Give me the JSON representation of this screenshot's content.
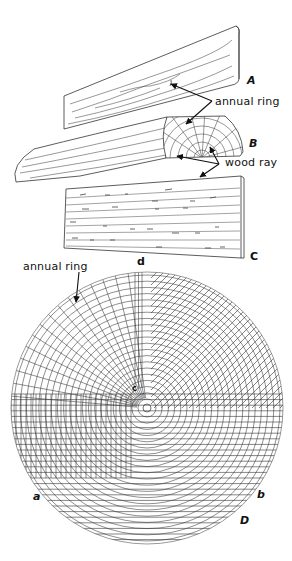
{
  "figure": {
    "labels": {
      "A": "A",
      "B": "B",
      "C": "C",
      "D": "D",
      "a": "a",
      "b": "b",
      "c": "c",
      "d": "d"
    },
    "annotations": {
      "annual_ring_top": "annual ring",
      "wood_ray": "wood ray",
      "annual_ring_bottom": "annual ring"
    }
  },
  "colors": {
    "ink": "#222222",
    "background": "#ffffff"
  }
}
